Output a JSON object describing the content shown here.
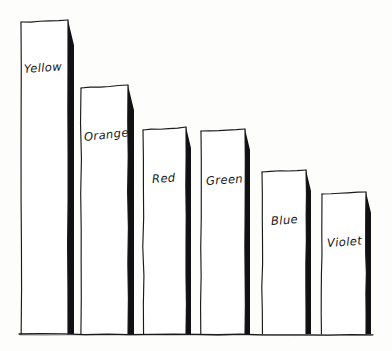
{
  "chart_data": {
    "type": "bar",
    "title": "",
    "subtitle": "",
    "xlabel": "",
    "ylabel": "",
    "categories": [
      "Yellow",
      "Orange",
      "Red",
      "Green",
      "Blue",
      "Violet"
    ],
    "values": [
      314,
      249,
      207,
      205,
      164,
      142
    ],
    "ylim": [
      0,
      330
    ],
    "grid": false,
    "legend": null,
    "style": "hand-drawn sketch, ink on paper, no axes ticks or numeric labels",
    "annotations": [],
    "bars": [
      {
        "category": "Yellow",
        "label": "Yellow",
        "value": 314,
        "x_left": 21,
        "x_right": 68,
        "top_y_left": 22,
        "top_y_right": 20,
        "shadow_width": 6,
        "label_x": 24,
        "label_y": 62,
        "label_rotation": -4
      },
      {
        "category": "Orange",
        "label": "Orange",
        "value": 249,
        "x_left": 81,
        "x_right": 128,
        "top_y_left": 88,
        "top_y_right": 85,
        "shadow_width": 6,
        "label_x": 84,
        "label_y": 130,
        "label_rotation": -6
      },
      {
        "category": "Red",
        "label": "Red",
        "value": 207,
        "x_left": 143,
        "x_right": 186,
        "top_y_left": 130,
        "top_y_right": 127,
        "shadow_width": 5,
        "label_x": 152,
        "label_y": 172,
        "label_rotation": -4
      },
      {
        "category": "Green",
        "label": "Green",
        "value": 205,
        "x_left": 201,
        "x_right": 245,
        "top_y_left": 131,
        "top_y_right": 129,
        "shadow_width": 5,
        "label_x": 206,
        "label_y": 174,
        "label_rotation": -4
      },
      {
        "category": "Blue",
        "label": "Blue",
        "value": 164,
        "x_left": 262,
        "x_right": 306,
        "top_y_left": 172,
        "top_y_right": 170,
        "shadow_width": 5,
        "label_x": 271,
        "label_y": 214,
        "label_rotation": -4
      },
      {
        "category": "Violet",
        "label": "Violet",
        "value": 142,
        "x_left": 322,
        "x_right": 366,
        "top_y_left": 194,
        "top_y_right": 192,
        "shadow_width": 5,
        "label_x": 327,
        "label_y": 236,
        "label_rotation": -4
      }
    ],
    "baseline": {
      "y": 334,
      "x_start": 19,
      "x_end": 373
    },
    "colors": {
      "ink": "#1a1a1d",
      "shadow": "#111113",
      "paper": "#fdfdfc",
      "outline": "#3a3a3e"
    }
  }
}
